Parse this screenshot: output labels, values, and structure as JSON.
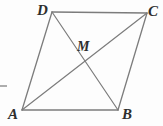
{
  "figure": {
    "kind": "geometry-diagram",
    "background_color": "#fdfdfd",
    "line_color": "#7c7c7c",
    "label_color": "#2e2e2e",
    "width": 163,
    "height": 126,
    "vertices": [
      {
        "id": "D",
        "label": "D",
        "x": 52,
        "y": 12
      },
      {
        "id": "C",
        "label": "C",
        "x": 147,
        "y": 13
      },
      {
        "id": "B",
        "label": "B",
        "x": 118,
        "y": 110
      },
      {
        "id": "A",
        "label": "A",
        "x": 22,
        "y": 110
      }
    ],
    "interior_points": [
      {
        "id": "M",
        "label": "M",
        "x": 84,
        "y": 61,
        "note": "intersection of diagonals"
      }
    ],
    "labels": [
      {
        "id": "label-D",
        "text": "D",
        "x": 37,
        "y": 3
      },
      {
        "id": "label-C",
        "text": "C",
        "x": 148,
        "y": 4
      },
      {
        "id": "label-A",
        "text": "A",
        "x": 8,
        "y": 107
      },
      {
        "id": "label-B",
        "text": "B",
        "x": 122,
        "y": 107
      },
      {
        "id": "label-M",
        "text": "M",
        "x": 77,
        "y": 39
      }
    ],
    "edges": [
      {
        "id": "edge-DC",
        "from": "D",
        "to": "C",
        "x1": 52,
        "y1": 12,
        "x2": 147,
        "y2": 13
      },
      {
        "id": "edge-CB",
        "from": "C",
        "to": "B",
        "x1": 147,
        "y1": 13,
        "x2": 118,
        "y2": 110
      },
      {
        "id": "edge-BA",
        "from": "B",
        "to": "A",
        "x1": 118,
        "y1": 110,
        "x2": 22,
        "y2": 110
      },
      {
        "id": "edge-AD",
        "from": "A",
        "to": "D",
        "x1": 22,
        "y1": 110,
        "x2": 52,
        "y2": 12
      }
    ],
    "diagonals": [
      {
        "id": "diagonal-AC",
        "from": "A",
        "to": "C",
        "x1": 22,
        "y1": 110,
        "x2": 147,
        "y2": 13
      },
      {
        "id": "diagonal-DB",
        "from": "D",
        "to": "B",
        "x1": 52,
        "y1": 12,
        "x2": 118,
        "y2": 110
      }
    ],
    "tick_mark": {
      "id": "left-edge-tick",
      "x1": 0,
      "y1": 86,
      "x2": 7,
      "y2": 86
    }
  }
}
